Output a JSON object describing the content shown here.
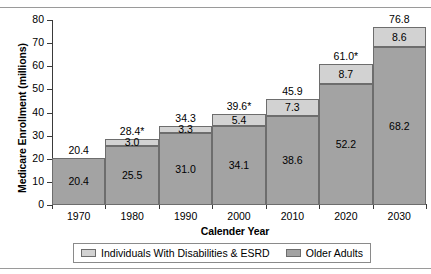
{
  "chart_data": {
    "type": "bar",
    "stacked": true,
    "title": "",
    "xlabel": "Calender Year",
    "ylabel": "Medicare Enrollment (millions)",
    "categories": [
      "1970",
      "1980",
      "1990",
      "2000",
      "2010",
      "2020",
      "2030"
    ],
    "ylim": [
      0,
      80
    ],
    "yticks": [
      0,
      10,
      20,
      30,
      40,
      50,
      60,
      70,
      80
    ],
    "ytick_labels": [
      "0",
      "10",
      "20",
      "30",
      "40",
      "50",
      "60",
      "70",
      "80"
    ],
    "grid": false,
    "legend_position": "bottom",
    "series": [
      {
        "name": "Older Adults",
        "color": "#a3a3a3",
        "values": [
          20.4,
          25.5,
          31.0,
          34.1,
          38.6,
          52.2,
          68.2
        ],
        "labels": [
          "20.4",
          "25.5",
          "31.0",
          "34.1",
          "38.6",
          "52.2",
          "68.2"
        ]
      },
      {
        "name": "Individuals With Disabilities & ESRD",
        "color": "#d2d2d2",
        "values": [
          0,
          3.0,
          3.3,
          5.4,
          7.3,
          8.7,
          8.6
        ],
        "labels": [
          "",
          "3.0",
          "3.3",
          "5.4",
          "7.3",
          "8.7",
          "8.6"
        ]
      }
    ],
    "totals": [
      20.4,
      28.4,
      34.3,
      39.6,
      45.9,
      61.0,
      76.8
    ],
    "total_labels": [
      "20.4",
      "28.4*",
      "34.3",
      "39.6*",
      "45.9",
      "61.0*",
      "76.8"
    ]
  },
  "legend": {
    "entries": [
      {
        "label": "Individuals With Disabilities & ESRD",
        "swatch": "light"
      },
      {
        "label": "Older Adults",
        "swatch": "dark"
      }
    ]
  },
  "colors": {
    "series_upper": "#d2d2d2",
    "series_lower": "#a3a3a3",
    "bar_edge": "#6d6d6d",
    "axis": "#3a3a3a",
    "text": "#000000",
    "background": "#ffffff"
  }
}
